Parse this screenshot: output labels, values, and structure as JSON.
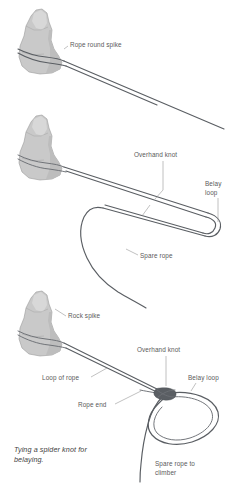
{
  "figure": {
    "title": "Tying a spider knot for belaying",
    "caption_line1": "Tying a spider knot for",
    "caption_line2": "belaying.",
    "colors": {
      "rope": "#5a5e63",
      "rope_secondary": "#6b6f74",
      "rock_fill": "#c9c9c9",
      "rock_outline": "#9a9a9a",
      "rock_shadow": "#bdbdbd",
      "rock_highlight": "#d8d8d8",
      "leader_line": "#8e8e8e",
      "label_text": "#5a5a5a",
      "caption_text": "#3f3f3f",
      "background": "#ffffff"
    }
  },
  "panels": [
    {
      "id": "panel-1",
      "step": 1,
      "description": "Rope passed around the rock spike with two long tails",
      "labels": [
        {
          "id": "rope-round-spike",
          "text": "Rope round spike",
          "lines": [
            "Rope round spike"
          ]
        }
      ]
    },
    {
      "id": "panel-2",
      "step": 2,
      "description": "Doubled rope from spike tied with an overhand knot forming a long belay loop, spare rope trailing",
      "labels": [
        {
          "id": "overhand-knot",
          "text": "Overhand knot",
          "lines": [
            "Overhand knot"
          ]
        },
        {
          "id": "belay-loop",
          "text": "Belay loop",
          "lines": [
            "Belay",
            "loop"
          ]
        },
        {
          "id": "spare-rope",
          "text": "Spare rope",
          "lines": [
            "Spare rope"
          ]
        }
      ]
    },
    {
      "id": "panel-3",
      "step": 3,
      "description": "Completed spider knot: loop of rope from rock spike, overhand knot, belay loop and spare rope to climber",
      "labels": [
        {
          "id": "rock-spike",
          "text": "Rock spike",
          "lines": [
            "Rock spike"
          ]
        },
        {
          "id": "overhand-knot",
          "text": "Overhand knot",
          "lines": [
            "Overhand knot"
          ]
        },
        {
          "id": "belay-loop",
          "text": "Belay loop",
          "lines": [
            "Belay loop"
          ]
        },
        {
          "id": "loop-of-rope",
          "text": "Loop of rope",
          "lines": [
            "Loop of rope"
          ]
        },
        {
          "id": "rope-end",
          "text": "Rope end",
          "lines": [
            "Rope end"
          ]
        },
        {
          "id": "spare-rope-to-climber",
          "text": "Spare rope to climber",
          "lines": [
            "Spare rope to",
            "climber"
          ]
        }
      ]
    }
  ]
}
